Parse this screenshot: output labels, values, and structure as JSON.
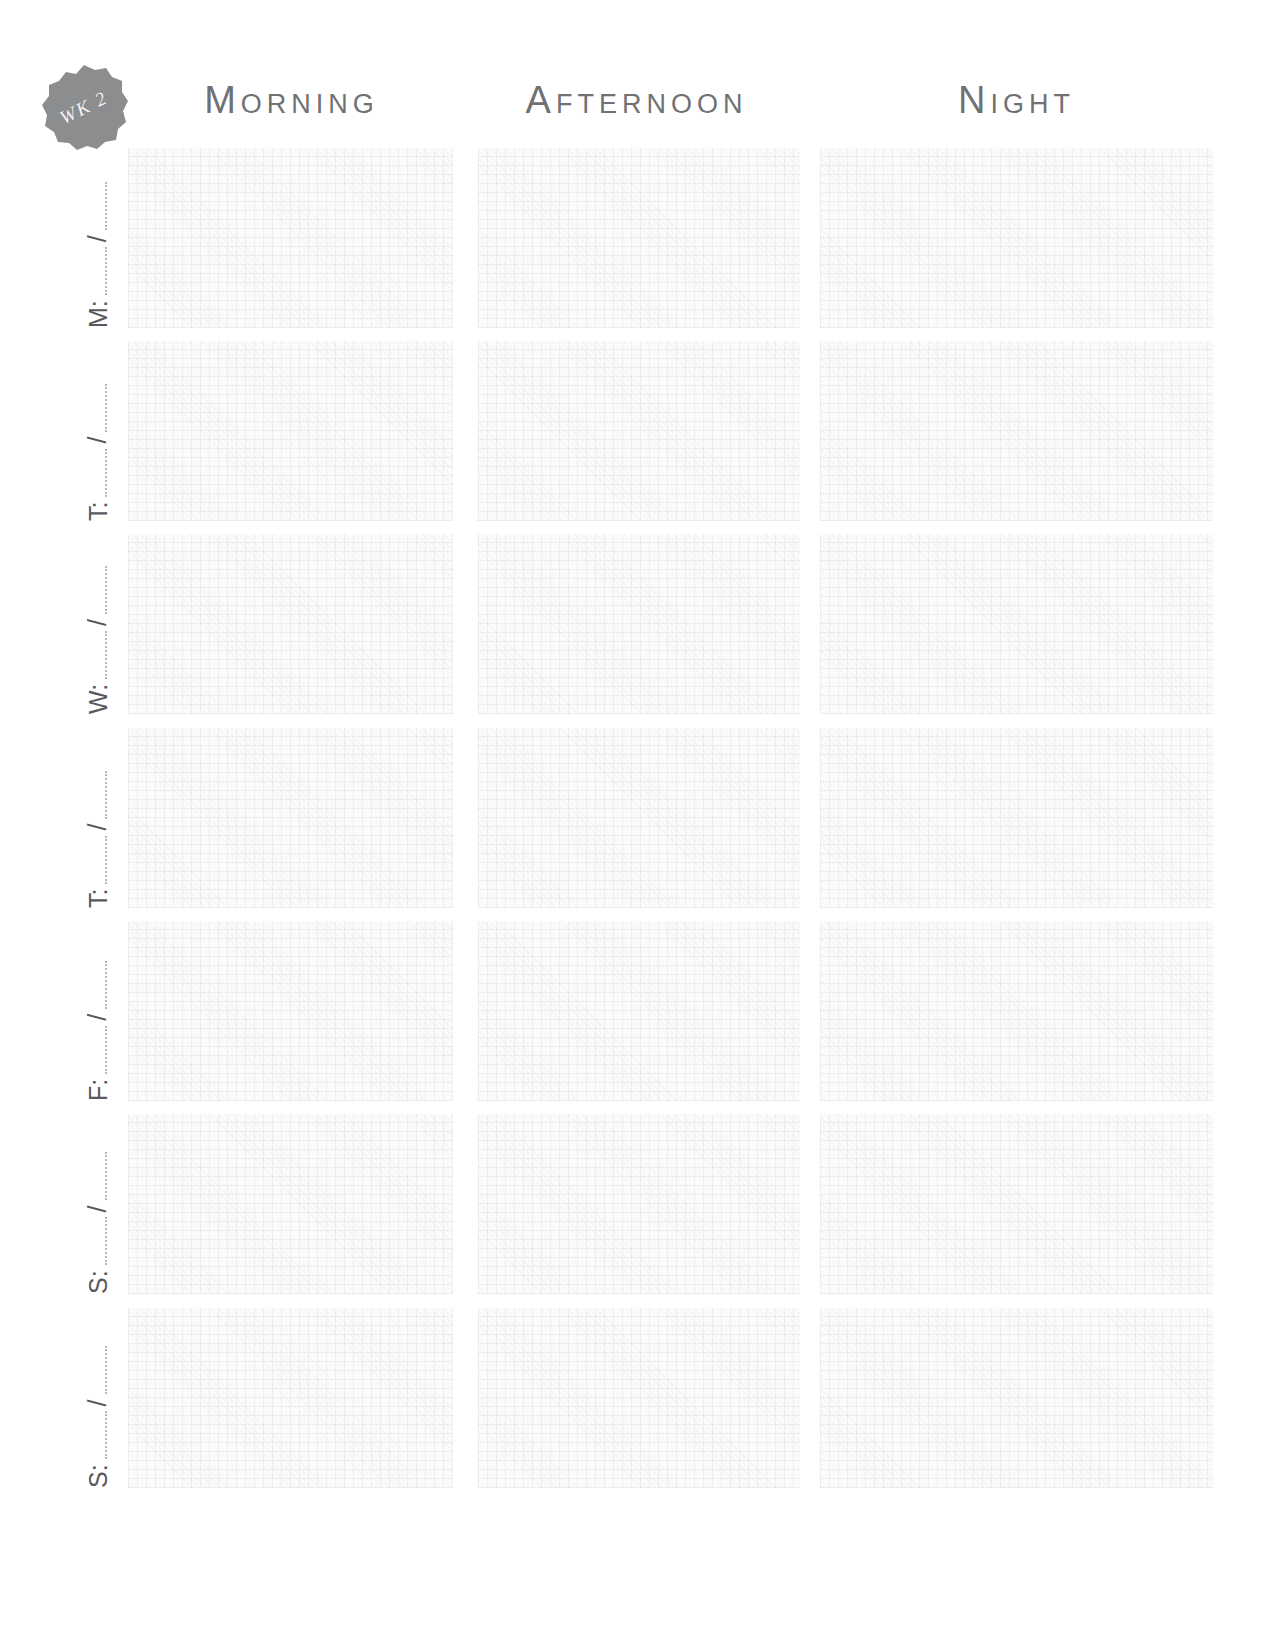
{
  "page": {
    "background_color": "#ffffff"
  },
  "badge": {
    "icon": "scalloped-seal-icon",
    "label": "WK 2",
    "fill_color": "#8c8d8f",
    "text_color": "#f4f4f4"
  },
  "headers": {
    "text_color": "#6f7173",
    "columns": [
      {
        "label": "Morning"
      },
      {
        "label": "Afternoon"
      },
      {
        "label": "Night"
      }
    ]
  },
  "day_label": {
    "separator": "/",
    "text_color": "#58595b",
    "line_color": "#b9babc"
  },
  "rows": [
    {
      "day": "M:",
      "date_left": "",
      "date_right": ""
    },
    {
      "day": "T:",
      "date_left": "",
      "date_right": ""
    },
    {
      "day": "W:",
      "date_left": "",
      "date_right": ""
    },
    {
      "day": "T:",
      "date_left": "",
      "date_right": ""
    },
    {
      "day": "F:",
      "date_left": "",
      "date_right": ""
    },
    {
      "day": "S:",
      "date_left": "",
      "date_right": ""
    },
    {
      "day": "S:",
      "date_left": "",
      "date_right": ""
    }
  ],
  "cells": {
    "fill_color": "#fbfbfb",
    "entries": [
      {
        "row": "M:",
        "morning": "",
        "afternoon": "",
        "night": ""
      },
      {
        "row": "T:",
        "morning": "",
        "afternoon": "",
        "night": ""
      },
      {
        "row": "W:",
        "morning": "",
        "afternoon": "",
        "night": ""
      },
      {
        "row": "T:",
        "morning": "",
        "afternoon": "",
        "night": ""
      },
      {
        "row": "F:",
        "morning": "",
        "afternoon": "",
        "night": ""
      },
      {
        "row": "S:",
        "morning": "",
        "afternoon": "",
        "night": ""
      },
      {
        "row": "S:",
        "morning": "",
        "afternoon": "",
        "night": ""
      }
    ]
  }
}
